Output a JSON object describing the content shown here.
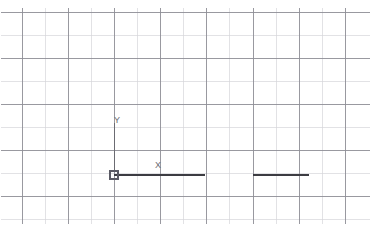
{
  "app": {
    "title": "CAD Drawing Canvas",
    "background_color": "#ffffff"
  },
  "canvas": {
    "name": "model-space-viewport",
    "width": 370,
    "height": 234
  },
  "grid": {
    "visible": true,
    "origin_x": 22,
    "origin_y": 12,
    "spacing": 23.1,
    "columns": 16,
    "rows": 10,
    "minor_color": "#d6d6da",
    "major_color": "#8e8e96",
    "major_every": 2,
    "minor_width": 0.7,
    "major_width": 0.9,
    "right_edge": 360,
    "bottom_edge": 224
  },
  "ucs_icon": {
    "name": "ucs-origin-marker",
    "origin_x": 114,
    "origin_y": 175,
    "square_size": 8,
    "color": "#5a5a64",
    "axis_color": "#6b6b72",
    "y_axis_length": 52,
    "x_label": "X",
    "y_label": "Y",
    "x_label_x": 160,
    "x_label_y": 167,
    "y_label_x": 118,
    "y_label_y": 122
  },
  "geometry": {
    "color": "#3c3c42",
    "line_width": 1.1,
    "entities": [
      {
        "name": "line-segment-left",
        "type": "line",
        "x1": 114,
        "y1": 175,
        "x2": 205,
        "y2": 175
      },
      {
        "name": "line-segment-right",
        "type": "line",
        "x1": 253,
        "y1": 175,
        "x2": 309,
        "y2": 175
      }
    ]
  }
}
